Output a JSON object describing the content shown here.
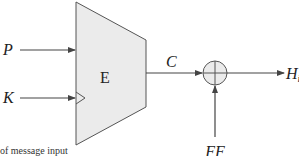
{
  "diagram": {
    "block_label": "E",
    "inputs": [
      {
        "label": "P",
        "type": "data"
      },
      {
        "label": "K",
        "type": "key"
      }
    ],
    "intermediate": {
      "label": "C"
    },
    "xor_operator": {
      "symbol": "circled-plus"
    },
    "feed_forward": {
      "label": "FF"
    },
    "output": {
      "label": "H",
      "subscript": "i"
    },
    "caption_fragment": "of message input"
  },
  "colors": {
    "block_fill": "#ebebeb",
    "stroke": "#555555",
    "text": "#222222"
  }
}
